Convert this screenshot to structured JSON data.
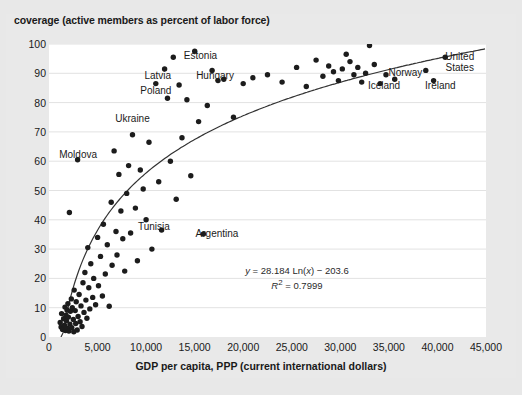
{
  "chart_data": {
    "type": "scatter",
    "title": "coverage (active members as percent of labor force)",
    "xlabel": "GDP per capita, PPP (current international dollars)",
    "ylabel": "coverage (active members as percent of labor force)",
    "xlim": [
      0,
      45000
    ],
    "ylim": [
      0,
      100
    ],
    "xticks": [
      0,
      5000,
      10000,
      15000,
      20000,
      25000,
      30000,
      35000,
      40000,
      45000
    ],
    "xticklabels": [
      "0",
      "5,000",
      "10,000",
      "15,000",
      "20,000",
      "25,000",
      "30,000",
      "35,000",
      "40,000",
      "45,000"
    ],
    "yticks": [
      0,
      10,
      20,
      30,
      40,
      50,
      60,
      70,
      80,
      90,
      100
    ],
    "yticklabels": [
      "0",
      "10",
      "20",
      "30",
      "40",
      "50",
      "60",
      "70",
      "80",
      "90",
      "100"
    ],
    "grid": "horizontal",
    "legend": "none",
    "marker_color": "#1c1c1c",
    "trendline_color": "#333333",
    "plot_bg": "#ffffff",
    "figure_bg": "#e8e8e8",
    "trendline": {
      "type": "logarithmic",
      "equation": "y = 28.184 Ln(x) − 203.6",
      "equation_y": "y",
      "equation_body": " = 28.184 Ln(",
      "r_squared_label": "R",
      "r_squared_value": " = 0.7999",
      "coefficient": 28.184,
      "intercept": -203.6,
      "r2": 0.7999
    },
    "annotations": [
      {
        "text": "Estonia",
        "x": 15600,
        "y": 96
      },
      {
        "text": "Latvia",
        "x": 11200,
        "y": 89
      },
      {
        "text": "Hungary",
        "x": 17100,
        "y": 89
      },
      {
        "text": "Poland",
        "x": 11000,
        "y": 84
      },
      {
        "text": "Ukraine",
        "x": 8600,
        "y": 74.5
      },
      {
        "text": "Moldova",
        "x": 3000,
        "y": 62
      },
      {
        "text": "Tunisia",
        "x": 10800,
        "y": 37.5
      },
      {
        "text": "Argentina",
        "x": 17300,
        "y": 35
      },
      {
        "text": "Norway",
        "x": 36700,
        "y": 90
      },
      {
        "text": "Iceland",
        "x": 34500,
        "y": 85.5
      },
      {
        "text": "Ireland",
        "x": 40300,
        "y": 85.5
      },
      {
        "text": "United States",
        "x": 42300,
        "y": 94
      }
    ],
    "points": [
      {
        "x": 1150,
        "y": 5.0
      },
      {
        "x": 1250,
        "y": 3.4
      },
      {
        "x": 1300,
        "y": 8.0
      },
      {
        "x": 1400,
        "y": 2.6
      },
      {
        "x": 1500,
        "y": 6.2
      },
      {
        "x": 1600,
        "y": 4.0
      },
      {
        "x": 1650,
        "y": 10.2
      },
      {
        "x": 1700,
        "y": 2.2
      },
      {
        "x": 1750,
        "y": 7.4
      },
      {
        "x": 1800,
        "y": 5.6
      },
      {
        "x": 1850,
        "y": 9.2
      },
      {
        "x": 1900,
        "y": 3.0
      },
      {
        "x": 1950,
        "y": 11.4
      },
      {
        "x": 2000,
        "y": 6.8
      },
      {
        "x": 2050,
        "y": 2.0
      },
      {
        "x": 2100,
        "y": 42.5
      },
      {
        "x": 2150,
        "y": 4.4
      },
      {
        "x": 2200,
        "y": 8.8
      },
      {
        "x": 2300,
        "y": 13.0
      },
      {
        "x": 2350,
        "y": 3.2
      },
      {
        "x": 2400,
        "y": 10.0
      },
      {
        "x": 2500,
        "y": 6.0
      },
      {
        "x": 2550,
        "y": 1.8
      },
      {
        "x": 2600,
        "y": 16.0
      },
      {
        "x": 2700,
        "y": 9.0
      },
      {
        "x": 2750,
        "y": 4.6
      },
      {
        "x": 2800,
        "y": 12.0
      },
      {
        "x": 2900,
        "y": 2.4
      },
      {
        "x": 2950,
        "y": 60.5
      },
      {
        "x": 3000,
        "y": 7.0
      },
      {
        "x": 3100,
        "y": 14.5
      },
      {
        "x": 3200,
        "y": 5.2
      },
      {
        "x": 3300,
        "y": 10.6
      },
      {
        "x": 3400,
        "y": 3.6
      },
      {
        "x": 3500,
        "y": 18.5
      },
      {
        "x": 3600,
        "y": 8.4
      },
      {
        "x": 3700,
        "y": 22.0
      },
      {
        "x": 3800,
        "y": 12.6
      },
      {
        "x": 3900,
        "y": 6.4
      },
      {
        "x": 4000,
        "y": 30.5
      },
      {
        "x": 4100,
        "y": 16.8
      },
      {
        "x": 4200,
        "y": 9.6
      },
      {
        "x": 4300,
        "y": 25.0
      },
      {
        "x": 4500,
        "y": 13.5
      },
      {
        "x": 4600,
        "y": 20.0
      },
      {
        "x": 4800,
        "y": 11.0
      },
      {
        "x": 5000,
        "y": 34.0
      },
      {
        "x": 5100,
        "y": 17.5
      },
      {
        "x": 5300,
        "y": 27.5
      },
      {
        "x": 5500,
        "y": 14.0
      },
      {
        "x": 5600,
        "y": 38.5
      },
      {
        "x": 5800,
        "y": 21.5
      },
      {
        "x": 6000,
        "y": 31.5
      },
      {
        "x": 6200,
        "y": 10.5
      },
      {
        "x": 6400,
        "y": 46.0
      },
      {
        "x": 6500,
        "y": 24.5
      },
      {
        "x": 6700,
        "y": 63.5
      },
      {
        "x": 6900,
        "y": 36.0
      },
      {
        "x": 7000,
        "y": 28.0
      },
      {
        "x": 7200,
        "y": 55.5
      },
      {
        "x": 7400,
        "y": 43.0
      },
      {
        "x": 7600,
        "y": 33.5
      },
      {
        "x": 7800,
        "y": 22.5
      },
      {
        "x": 8000,
        "y": 49.0
      },
      {
        "x": 8200,
        "y": 58.5
      },
      {
        "x": 8400,
        "y": 35.5
      },
      {
        "x": 8600,
        "y": 69.0
      },
      {
        "x": 8900,
        "y": 44.0
      },
      {
        "x": 9100,
        "y": 26.0
      },
      {
        "x": 9400,
        "y": 57.0
      },
      {
        "x": 9700,
        "y": 50.5
      },
      {
        "x": 10000,
        "y": 40.0
      },
      {
        "x": 10300,
        "y": 66.5
      },
      {
        "x": 10600,
        "y": 30.0
      },
      {
        "x": 11000,
        "y": 86.5
      },
      {
        "x": 11300,
        "y": 53.0
      },
      {
        "x": 11600,
        "y": 36.5
      },
      {
        "x": 11900,
        "y": 91.5
      },
      {
        "x": 12200,
        "y": 81.5
      },
      {
        "x": 12500,
        "y": 60.0
      },
      {
        "x": 12800,
        "y": 95.5
      },
      {
        "x": 13100,
        "y": 47.0
      },
      {
        "x": 13400,
        "y": 86.0
      },
      {
        "x": 13700,
        "y": 68.0
      },
      {
        "x": 14200,
        "y": 81.0
      },
      {
        "x": 14600,
        "y": 55.0
      },
      {
        "x": 15000,
        "y": 97.5
      },
      {
        "x": 15400,
        "y": 73.5
      },
      {
        "x": 15900,
        "y": 35.2
      },
      {
        "x": 16300,
        "y": 79.0
      },
      {
        "x": 16800,
        "y": 91.0
      },
      {
        "x": 17400,
        "y": 87.5
      },
      {
        "x": 18000,
        "y": 88.0
      },
      {
        "x": 19000,
        "y": 75.0
      },
      {
        "x": 20000,
        "y": 86.5
      },
      {
        "x": 21000,
        "y": 88.5
      },
      {
        "x": 22500,
        "y": 89.5
      },
      {
        "x": 24000,
        "y": 87.0
      },
      {
        "x": 25500,
        "y": 92.0
      },
      {
        "x": 26500,
        "y": 85.5
      },
      {
        "x": 27500,
        "y": 94.5
      },
      {
        "x": 28200,
        "y": 89.0
      },
      {
        "x": 28800,
        "y": 92.5
      },
      {
        "x": 29300,
        "y": 90.5
      },
      {
        "x": 29800,
        "y": 87.5
      },
      {
        "x": 30200,
        "y": 91.5
      },
      {
        "x": 30600,
        "y": 96.5
      },
      {
        "x": 31000,
        "y": 94.0
      },
      {
        "x": 31400,
        "y": 89.5
      },
      {
        "x": 31800,
        "y": 92.0
      },
      {
        "x": 32200,
        "y": 87.0
      },
      {
        "x": 32600,
        "y": 90.0
      },
      {
        "x": 33000,
        "y": 99.5
      },
      {
        "x": 33500,
        "y": 93.0
      },
      {
        "x": 34100,
        "y": 86.5
      },
      {
        "x": 34700,
        "y": 89.5
      },
      {
        "x": 35600,
        "y": 88.0
      },
      {
        "x": 38800,
        "y": 91.0
      },
      {
        "x": 39600,
        "y": 87.5
      },
      {
        "x": 40800,
        "y": 95.5
      }
    ]
  }
}
